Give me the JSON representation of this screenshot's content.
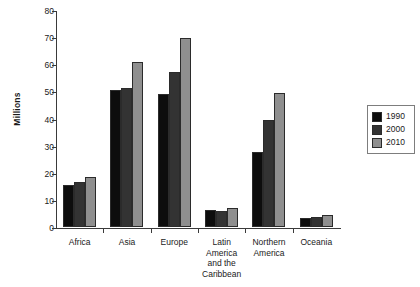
{
  "chart_data": {
    "type": "bar",
    "title": "",
    "xlabel": "",
    "ylabel": "Millions",
    "ylim": [
      0,
      80
    ],
    "yticks": [
      0,
      10,
      20,
      30,
      40,
      50,
      60,
      70,
      80
    ],
    "ytick_labels": [
      "0",
      "10",
      "20",
      "30",
      "40",
      "50",
      "60",
      "70",
      "80"
    ],
    "grid": false,
    "legend_position": "right",
    "categories": [
      "Africa",
      "Asia",
      "Europe",
      "Latin\nAmerica\nand the\nCaribbean",
      "Northern\nAmerica",
      "Oceania"
    ],
    "series": [
      {
        "name": "1990",
        "color": "#0d0d0d",
        "values": [
          15.6,
          50.4,
          49.0,
          6.2,
          27.5,
          3.3
        ]
      },
      {
        "name": "2000",
        "color": "#333333",
        "values": [
          16.5,
          51.2,
          57.0,
          6.0,
          39.5,
          3.8
        ]
      },
      {
        "name": "2010",
        "color": "#8f8f8f",
        "values": [
          18.6,
          61.0,
          69.5,
          7.0,
          49.5,
          4.6
        ]
      }
    ]
  },
  "legend": {
    "items": [
      {
        "label": "1990"
      },
      {
        "label": "2000"
      },
      {
        "label": "2010"
      }
    ]
  }
}
